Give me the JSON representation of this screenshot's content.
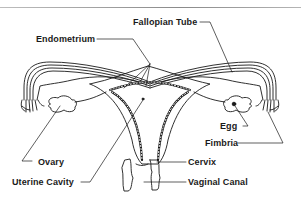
{
  "diagram": {
    "labels": {
      "fallopian_tube": "Fallopian Tube",
      "endometrium": "Endometrium",
      "egg": "Egg",
      "fimbria": "Fimbria",
      "ovary": "Ovary",
      "cervix": "Cervix",
      "uterine_cavity": "Uterine Cavity",
      "vaginal_canal": "Vaginal Canal"
    },
    "colors": {
      "line": "#1a1a1a",
      "background": "#ffffff",
      "top_rule": "#9a9a9a"
    }
  }
}
